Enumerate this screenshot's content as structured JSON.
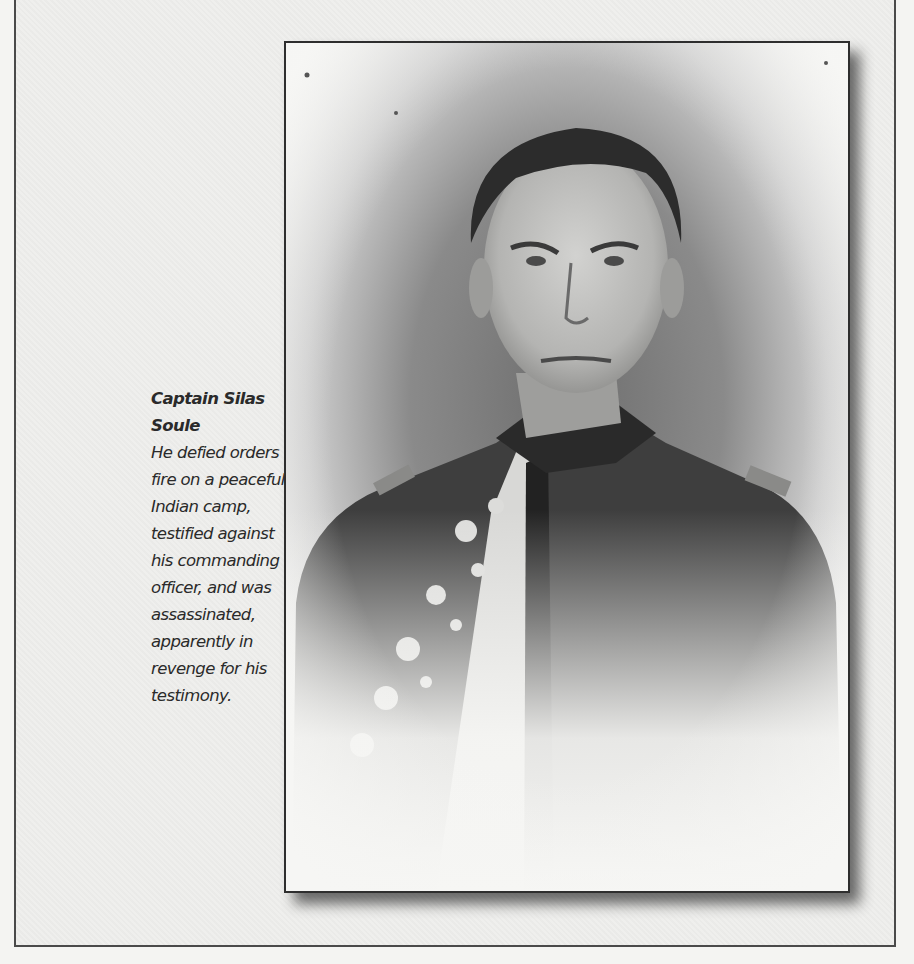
{
  "caption": {
    "title": "Captain Silas Soule",
    "lines": [
      "He defied orders to",
      "fire on a peaceful",
      "Indian camp,",
      "testified against",
      "his commanding",
      "officer, and was",
      "assassinated,",
      "apparently in",
      "revenge for his",
      "testimony."
    ]
  },
  "photo": {
    "subject": "Portrait of Captain Silas Soule in military uniform",
    "style": "black-and-white vignette photograph"
  },
  "colors": {
    "page_background": "#efefed",
    "frame_border": "#4a4a4a",
    "caption_text": "#2a2a2a"
  }
}
